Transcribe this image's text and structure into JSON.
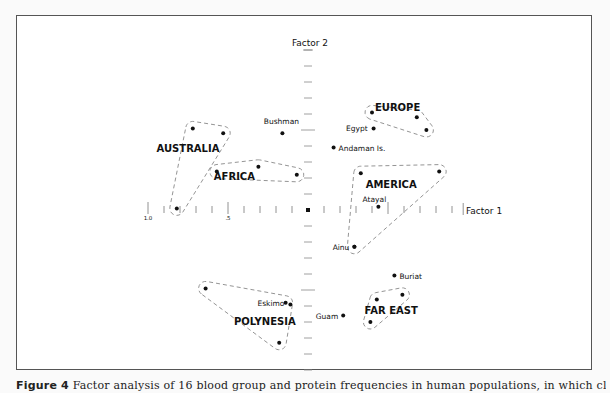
{
  "chart_data": {
    "type": "scatter",
    "title": "",
    "xlabel": "Factor 1",
    "ylabel": "Factor 2",
    "x_tick_labels": [
      {
        "value": -1.0,
        "label": "1.0"
      },
      {
        "value": -0.5,
        "label": ".5"
      }
    ],
    "x_tick_step": 0.1,
    "y_tick_step": 0.1,
    "xlim": [
      -1.0,
      1.0
    ],
    "ylim": [
      -1.0,
      1.0
    ],
    "grid": false,
    "origin_marker": true,
    "groups": [
      {
        "name": "AUSTRALIA",
        "points": [
          [
            -0.72,
            0.51
          ],
          [
            -0.53,
            0.48
          ],
          [
            -0.82,
            0.01
          ]
        ]
      },
      {
        "name": "AFRICA",
        "points": [
          [
            -0.57,
            0.24
          ],
          [
            -0.31,
            0.27
          ],
          [
            -0.07,
            0.22
          ]
        ]
      },
      {
        "name": "EUROPE",
        "points": [
          [
            0.4,
            0.61
          ],
          [
            0.68,
            0.58
          ],
          [
            0.74,
            0.5
          ]
        ]
      },
      {
        "name": "AMERICA",
        "points": [
          [
            0.33,
            0.23
          ],
          [
            0.82,
            0.24
          ],
          [
            0.29,
            -0.23
          ]
        ]
      },
      {
        "name": "FAR EAST",
        "points": [
          [
            0.43,
            -0.56
          ],
          [
            0.59,
            -0.53
          ],
          [
            0.39,
            -0.7
          ]
        ]
      },
      {
        "name": "POLYNESIA",
        "points": [
          [
            -0.64,
            -0.49
          ],
          [
            -0.14,
            -0.58
          ],
          [
            -0.18,
            -0.83
          ]
        ]
      }
    ],
    "labeled_points": [
      {
        "name": "Bushman",
        "x": -0.16,
        "y": 0.48
      },
      {
        "name": "Egypt",
        "x": 0.41,
        "y": 0.51
      },
      {
        "name": "Andaman Is.",
        "x": 0.16,
        "y": 0.39
      },
      {
        "name": "Atayal",
        "x": 0.44,
        "y": 0.02
      },
      {
        "name": "Ainu",
        "x": 0.29,
        "y": -0.23
      },
      {
        "name": "Buriat",
        "x": 0.54,
        "y": -0.41
      },
      {
        "name": "Guam",
        "x": 0.22,
        "y": -0.66
      },
      {
        "name": "Eskimo",
        "x": -0.11,
        "y": -0.59
      }
    ]
  },
  "caption": {
    "prefix": "Figure 4",
    "text": "  Factor analysis of 16 blood group and protein frequencies in human populations, in which clusters are circled and labeled"
  }
}
